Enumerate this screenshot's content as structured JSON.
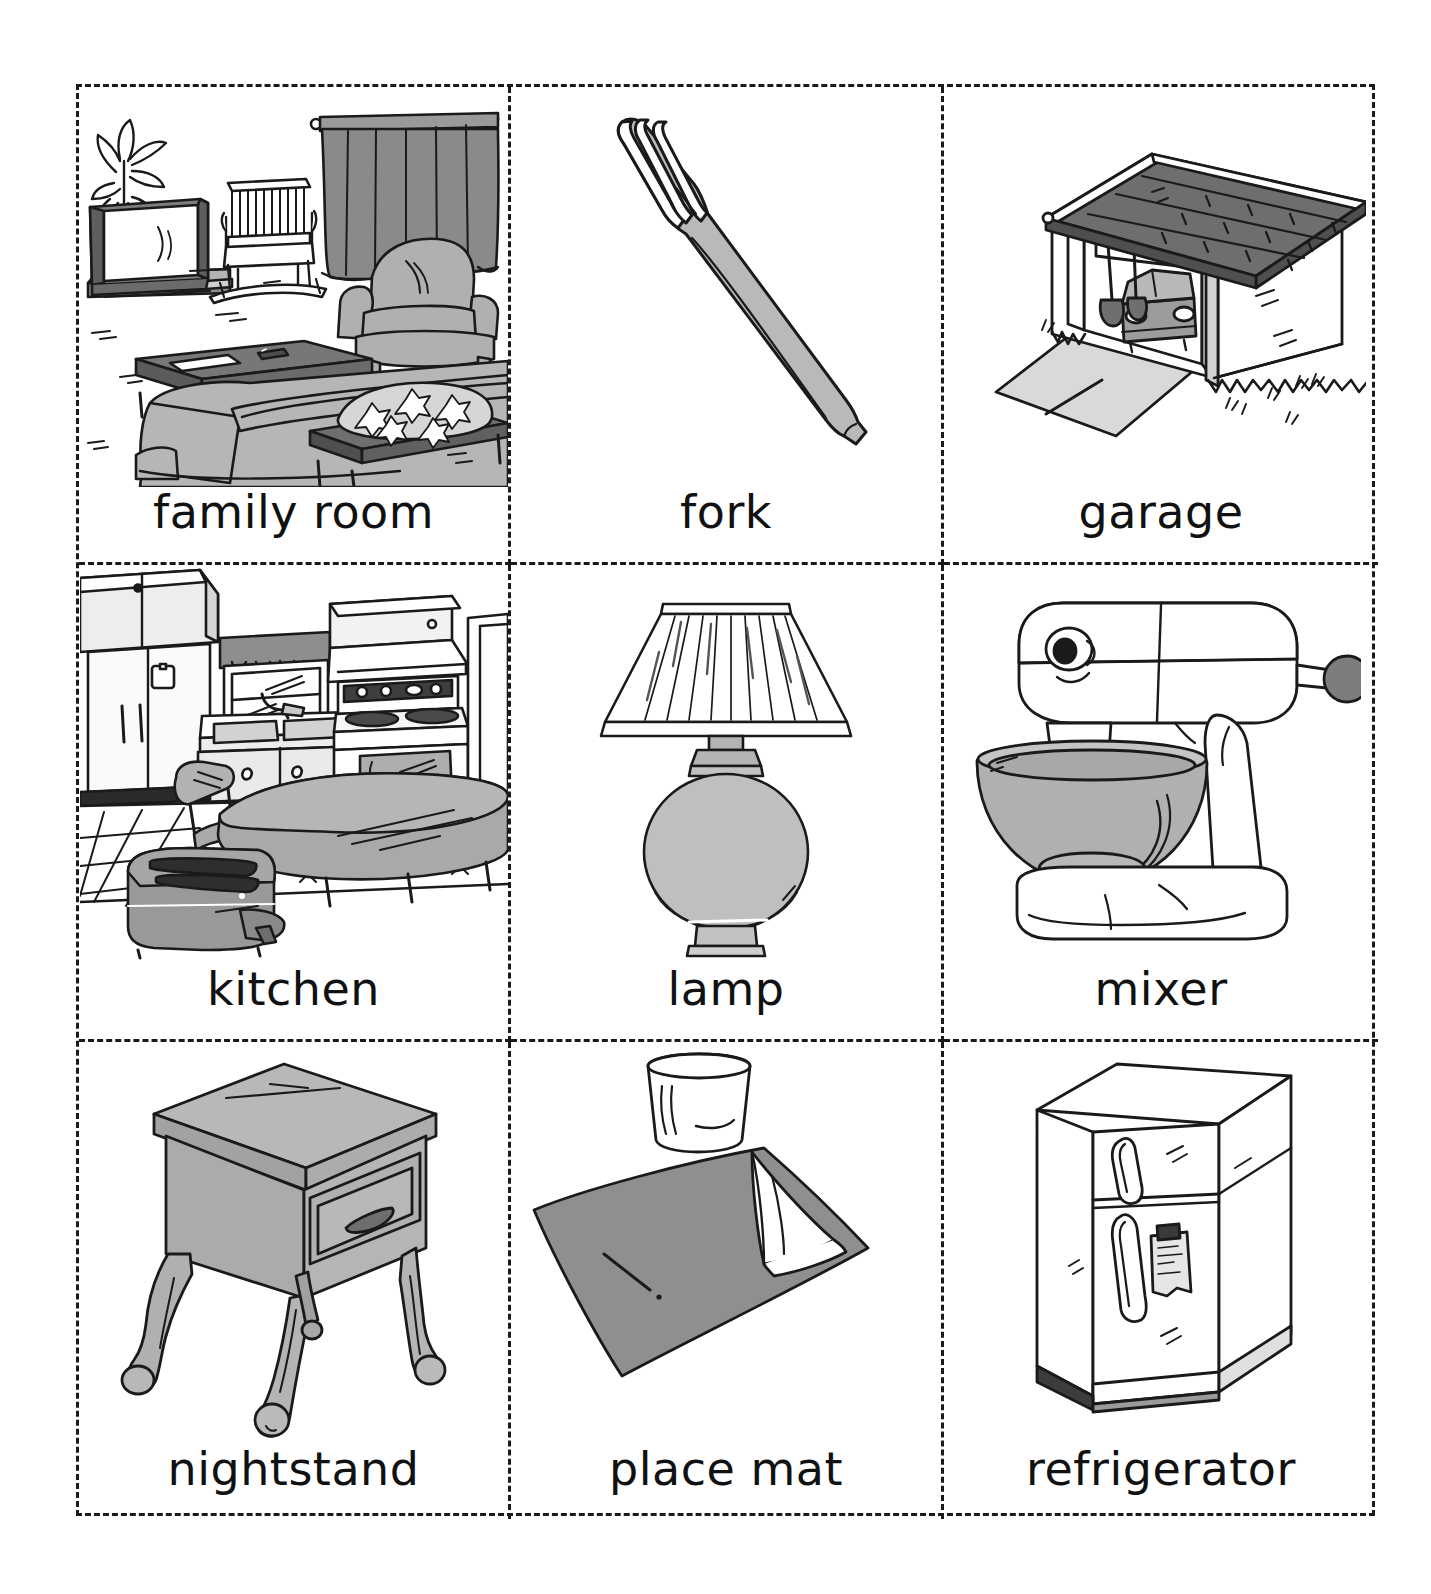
{
  "sheet": {
    "title": "Picture vocabulary flashcards",
    "columns": 3,
    "rows": 3,
    "cut_line_style": "dashed",
    "cut_line_color": "#1a1a1a",
    "background": "#ffffff"
  },
  "palette": {
    "ink": "#1a1a1a",
    "gray_dark": "#6e6e6e",
    "gray_mid": "#969696",
    "gray_light": "#c8c8c8",
    "gray_pale": "#e2e2e2",
    "white": "#ffffff"
  },
  "cards": [
    {
      "id": "family-room",
      "label": "family room",
      "icon": "family-room-scene-icon",
      "row": 1,
      "column": 1,
      "contents": [
        "television",
        "potted palm plant",
        "rocking chair",
        "curtains",
        "armchair",
        "sofa",
        "coffee table",
        "remote control",
        "magazine",
        "side table",
        "floral pillow"
      ]
    },
    {
      "id": "fork",
      "label": "fork",
      "icon": "fork-icon",
      "row": 1,
      "column": 2,
      "contents": [
        "four-tine dinner fork"
      ]
    },
    {
      "id": "garage",
      "label": "garage",
      "icon": "garage-icon",
      "row": 1,
      "column": 3,
      "contents": [
        "detached garage",
        "shingled roof",
        "open door",
        "car",
        "shovel",
        "driveway",
        "grass"
      ]
    },
    {
      "id": "kitchen",
      "label": "kitchen",
      "icon": "kitchen-scene-icon",
      "row": 2,
      "column": 1,
      "contents": [
        "refrigerator",
        "upper cabinets",
        "window",
        "valance",
        "sink",
        "faucet",
        "base cabinets",
        "stove",
        "range hood",
        "round table",
        "chair",
        "toaster",
        "tile floor"
      ]
    },
    {
      "id": "lamp",
      "label": "lamp",
      "icon": "lamp-icon",
      "row": 2,
      "column": 2,
      "contents": [
        "pleated shade",
        "urn-shaped base",
        "round foot"
      ]
    },
    {
      "id": "mixer",
      "label": "mixer",
      "icon": "stand-mixer-icon",
      "row": 2,
      "column": 3,
      "contents": [
        "stand mixer head",
        "speed knob",
        "beater",
        "mixing bowl",
        "base"
      ]
    },
    {
      "id": "nightstand",
      "label": "nightstand",
      "icon": "nightstand-icon",
      "row": 3,
      "column": 1,
      "contents": [
        "square top",
        "single drawer",
        "drawer pull",
        "four cabriole legs"
      ]
    },
    {
      "id": "place-mat",
      "label": "place mat",
      "icon": "place-mat-icon",
      "row": 3,
      "column": 2,
      "contents": [
        "gray rectangular mat",
        "folded napkin",
        "drinking glass"
      ]
    },
    {
      "id": "refrigerator",
      "label": "refrigerator",
      "icon": "refrigerator-icon",
      "row": 3,
      "column": 3,
      "contents": [
        "freezer door",
        "fresh food door",
        "two handles",
        "note held by magnet"
      ]
    }
  ]
}
